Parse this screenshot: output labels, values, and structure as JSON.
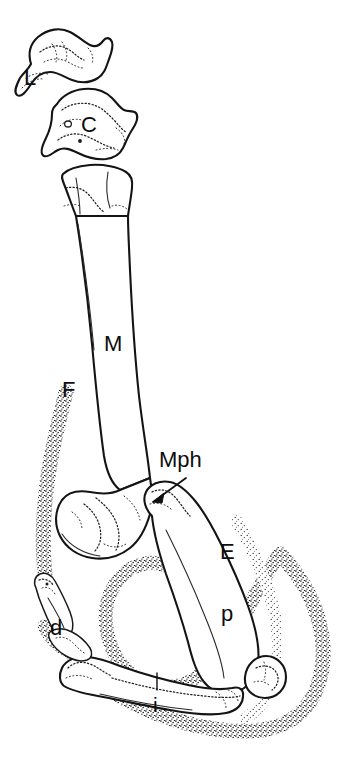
{
  "figure": {
    "kind": "anatomical-line-drawing",
    "background_color": "#ffffff",
    "ink_color": "#141414",
    "label_color": "#0d0d0d",
    "stipple_color": "#1a1a1a",
    "canvas": {
      "width": 339,
      "height": 781
    }
  },
  "labels": [
    {
      "id": "L",
      "text": "L",
      "element_name": "label-L",
      "x": 24,
      "y": 67,
      "size_class": "label-md",
      "has_leader": false,
      "describes": "upper irregular proximal element"
    },
    {
      "id": "C",
      "text": "C",
      "element_name": "label-C",
      "x": 81,
      "y": 114,
      "size_class": "label-md",
      "has_leader": false,
      "describes": "second irregular element below L"
    },
    {
      "id": "M",
      "text": "M",
      "element_name": "label-M",
      "x": 104,
      "y": 333,
      "size_class": "label-md",
      "has_leader": false,
      "describes": "long bone shaft"
    },
    {
      "id": "F",
      "text": "F",
      "element_name": "label-F",
      "x": 62,
      "y": 379,
      "size_class": "label-md",
      "has_leader": false,
      "describes": "stippled band along the flexor side"
    },
    {
      "id": "Mph",
      "text": "Mph",
      "element_name": "label-Mph",
      "x": 159,
      "y": 449,
      "size_class": "label-md",
      "has_leader": true,
      "describes": "joint region indicated by arrow"
    },
    {
      "id": "E",
      "text": "E",
      "element_name": "label-E",
      "x": 220,
      "y": 541,
      "size_class": "label-md",
      "has_leader": false,
      "describes": "stippled envelope on distal segment"
    },
    {
      "id": "p",
      "text": "p",
      "element_name": "label-p",
      "x": 221,
      "y": 603,
      "size_class": "label-md",
      "has_leader": false,
      "describes": "proximal phalangeal element"
    },
    {
      "id": "d",
      "text": "d",
      "element_name": "label-d",
      "x": 50,
      "y": 617,
      "size_class": "label-md",
      "has_leader": false,
      "describes": "small distal element"
    },
    {
      "id": "i",
      "text": "i",
      "element_name": "label-i",
      "x": 153,
      "y": 694,
      "size_class": "label-sm",
      "has_leader": true,
      "describes": "intermediate horizontal element"
    }
  ],
  "annotations": {
    "mph_arrow": {
      "name": "mph-arrow",
      "from": {
        "x": 186,
        "y": 478
      },
      "to": {
        "x": 151,
        "y": 503
      }
    },
    "i_leader": {
      "name": "i-leader",
      "from": {
        "x": 157,
        "y": 686
      },
      "to": {
        "x": 157,
        "y": 672
      }
    }
  }
}
